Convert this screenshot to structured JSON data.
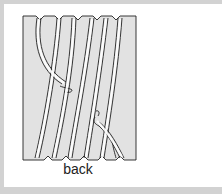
{
  "figure": {
    "caption": "back",
    "drum_fill": "#e2e2e2",
    "line_color": "#222222",
    "frame_color": "#d2d2d2"
  }
}
